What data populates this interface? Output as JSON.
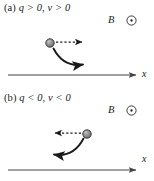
{
  "figure": {
    "panels": [
      {
        "id": "a",
        "tag": "(a)",
        "condition": "q > 0, v > 0",
        "field_label": "B",
        "field_symbol": "circled-dot",
        "field_direction": "out-of-page",
        "axis_label": "x",
        "particle": {
          "cx": 50,
          "cy": 43,
          "r": 4.2,
          "fill": "#8c8c8c",
          "stroke": "#3a3a3a"
        },
        "velocity_arrow": {
          "style": "dashed",
          "from_x": 56,
          "to_x": 86,
          "y": 42,
          "direction": "right"
        },
        "force_curve": {
          "direction": "clockwise-down-right",
          "arrowhead_at": "lower-right"
        },
        "axis": {
          "x1": 8,
          "x2": 139,
          "y": 75
        }
      },
      {
        "id": "b",
        "tag": "(b)",
        "condition": "q < 0, v < 0",
        "field_label": "B",
        "field_symbol": "circled-dot",
        "field_direction": "out-of-page",
        "axis_label": "x",
        "particle": {
          "cx": 87,
          "cy": 134,
          "r": 4.2,
          "fill": "#8c8c8c",
          "stroke": "#3a3a3a"
        },
        "velocity_arrow": {
          "style": "dashed",
          "from_x": 81,
          "to_x": 51,
          "y": 133,
          "direction": "left"
        },
        "force_curve": {
          "direction": "counterclockwise-down-left",
          "arrowhead_at": "lower-left"
        },
        "axis": {
          "x1": 8,
          "x2": 139,
          "y": 170
        }
      }
    ],
    "colors": {
      "ink": "#1a1a1a",
      "axis": "#444444",
      "particle_fill": "#8c8c8c",
      "particle_stroke": "#3a3a3a",
      "background": "#ffffff"
    }
  }
}
